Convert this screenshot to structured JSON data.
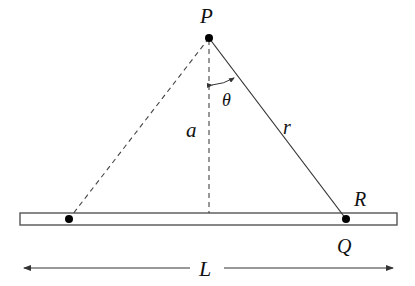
{
  "diagram": {
    "type": "geometry-physics",
    "labels": {
      "P": "P",
      "theta": "θ",
      "a": "a",
      "r": "r",
      "R": "R",
      "Q": "Q",
      "L": "L"
    },
    "points": {
      "P": {
        "x": 209,
        "y": 38
      },
      "Q": {
        "x": 346,
        "y": 219
      },
      "left_point": {
        "x": 69,
        "y": 219
      },
      "foot": {
        "x": 209,
        "y": 213
      }
    },
    "rod": {
      "x1": 20,
      "x2": 397,
      "y_top": 213,
      "y_bottom": 225
    },
    "dimension": {
      "label": "L",
      "y": 268,
      "x1": 22,
      "x2": 395
    },
    "colors": {
      "line": "#333333",
      "point": "#000000",
      "rod_fill": "#ffffff"
    }
  }
}
